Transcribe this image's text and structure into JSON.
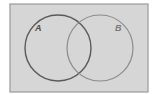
{
  "diagram": {
    "type": "venn",
    "universe": {
      "x": 10,
      "y": 4,
      "width": 138,
      "height": 88,
      "fill": "#d6d6d6",
      "stroke": "#9a9a9a"
    },
    "sets": [
      {
        "label": "A",
        "cx": 58,
        "cy": 48,
        "r": 33,
        "stroke": "#5a5a5a",
        "label_x": 35,
        "label_y": 31,
        "label_color": "#4a4a4a"
      },
      {
        "label": "B",
        "cx": 100,
        "cy": 48,
        "r": 33,
        "stroke": "#8c8c8c",
        "label_x": 115,
        "label_y": 31,
        "label_color": "#7a7a7a"
      }
    ]
  }
}
